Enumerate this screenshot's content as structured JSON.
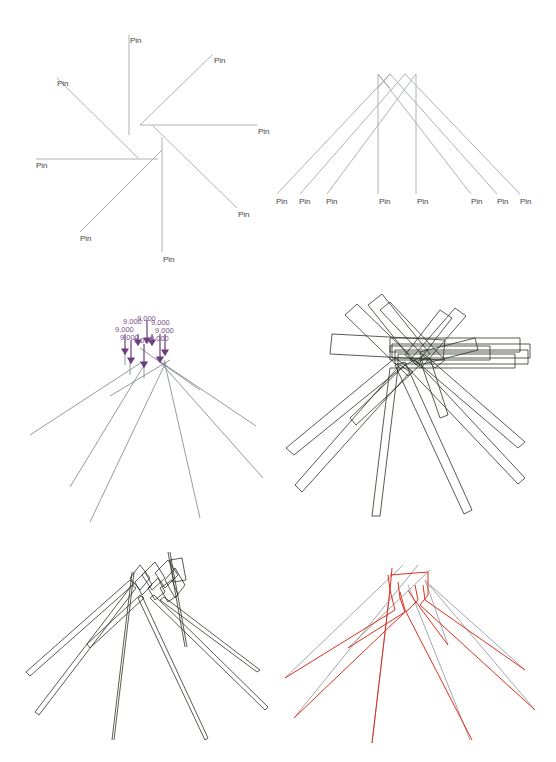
{
  "figure": {
    "panels": [
      {
        "id": "a",
        "description": "Pinwheel: 8 lines radiating from a center, each ending at a Pin label",
        "pin_label": "Pin",
        "pin_count": 8,
        "line_color": "#9aa0a8"
      },
      {
        "id": "b",
        "description": "Fan: 8 lines from top cluster crossing down to a row of Pin labels",
        "pin_label": "Pin",
        "pin_count": 8,
        "line_color": "#9aa0a8"
      },
      {
        "id": "c",
        "description": "Fan with load arrows at the top, each labeled with a force value",
        "value_label": "9.000",
        "value_count": 8,
        "arrow_color": "#6b3d7d",
        "line_color": "#6e7480"
      },
      {
        "id": "d",
        "description": "Thick rectangular beams (outlined) in a tangled fan",
        "line_color": "#2b3327"
      },
      {
        "id": "e",
        "description": "Thin outlined beams in a fan converging at top",
        "line_color": "#2b3327"
      },
      {
        "id": "f",
        "description": "Deformed (red) overlaid on undeformed (grey) fan",
        "deformed_color": "#e0301e",
        "undeformed_color": "#8a9299"
      }
    ]
  },
  "labels": {
    "pin": "Pin",
    "value": "9.000"
  }
}
